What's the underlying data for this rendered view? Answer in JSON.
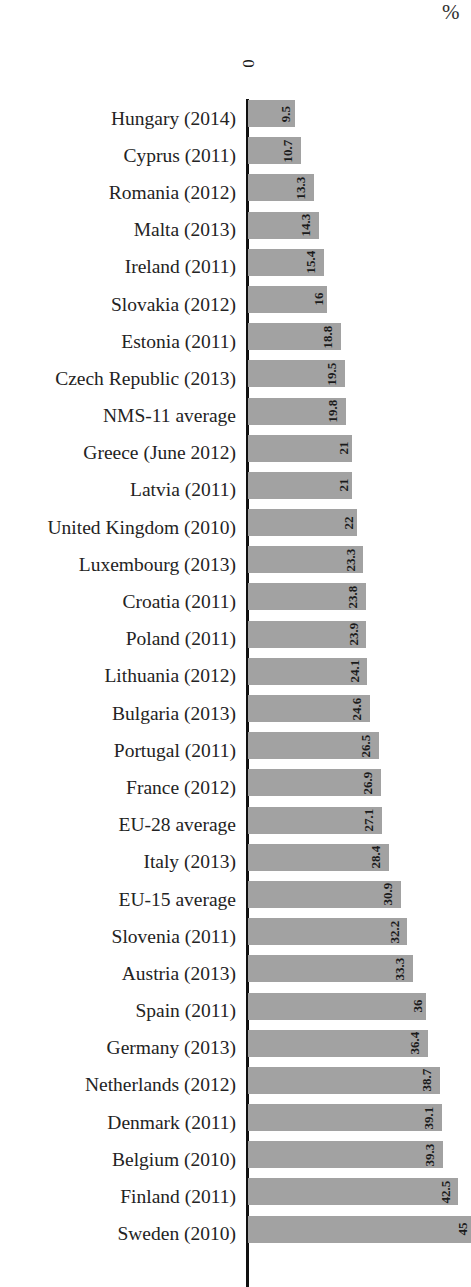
{
  "chart_data": {
    "type": "bar",
    "orientation": "horizontal",
    "title": "",
    "xlabel": "",
    "ylabel": "",
    "unit_label": "%",
    "grid": false,
    "legend": null,
    "axis_tick_labels": [
      "0"
    ],
    "xlim": [
      0,
      45
    ],
    "sort": "ascending",
    "bar_color": "#a2a2a2",
    "axis_color": "#101010",
    "value_label_position": "inside-end-rotated",
    "categories": [
      "Hungary (2014)",
      "Cyprus (2011)",
      "Romania (2012)",
      "Malta (2013)",
      "Ireland (2011)",
      "Slovakia (2012)",
      "Estonia (2011)",
      "Czech Republic (2013)",
      "NMS-11 average",
      "Greece (June 2012)",
      "Latvia (2011)",
      "United Kingdom (2010)",
      "Luxembourg (2013)",
      "Croatia (2011)",
      "Poland (2011)",
      "Lithuania (2012)",
      "Bulgaria (2013)",
      "Portugal (2011)",
      "France (2012)",
      "EU-28 average",
      "Italy (2013)",
      "EU-15 average",
      "Slovenia (2011)",
      "Austria (2013)",
      "Spain (2011)",
      "Germany (2013)",
      "Netherlands (2012)",
      "Denmark (2011)",
      "Belgium (2010)",
      "Finland (2011)",
      "Sweden (2010)"
    ],
    "values": [
      9.5,
      10.7,
      13.3,
      14.3,
      15.4,
      16,
      18.8,
      19.5,
      19.8,
      21,
      21,
      22,
      23.3,
      23.8,
      23.9,
      24.1,
      24.6,
      26.5,
      26.9,
      27.1,
      28.4,
      30.9,
      32.2,
      33.3,
      36,
      36.4,
      38.7,
      39.1,
      39.3,
      42.5,
      45
    ],
    "value_labels": [
      "9.5",
      "10.7",
      "13.3",
      "14.3",
      "15.4",
      "16",
      "18.8",
      "19.5",
      "19.8",
      "21",
      "21",
      "22",
      "23.3",
      "23.8",
      "23.9",
      "24.1",
      "24.6",
      "26.5",
      "26.9",
      "27.1",
      "28.4",
      "30.9",
      "32.2",
      "33.3",
      "36",
      "36.4",
      "38.7",
      "39.1",
      "39.3",
      "42.5",
      "45"
    ]
  }
}
